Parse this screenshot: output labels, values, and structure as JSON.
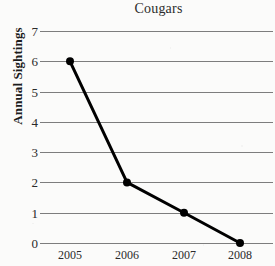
{
  "chart_data": {
    "type": "line",
    "title": "Cougars",
    "xlabel": "",
    "ylabel": "Annual Sightings",
    "categories": [
      "2005",
      "2006",
      "2007",
      "2008"
    ],
    "values": [
      6,
      2,
      1,
      0
    ],
    "series": [
      {
        "name": "Annual Sightings",
        "values": [
          6,
          2,
          1,
          0
        ]
      }
    ],
    "x": [
      2005,
      2006,
      2007,
      2008
    ],
    "ylim": [
      0,
      7
    ],
    "y_ticks": [
      0,
      1,
      2,
      3,
      4,
      5,
      6,
      7
    ],
    "y_tick_labels": [
      "0",
      "1",
      "2",
      "3",
      "4",
      "5",
      "6",
      "7"
    ],
    "x_tick_labels": [
      "2005",
      "2006",
      "2007",
      "2008"
    ],
    "grid": "horizontal",
    "legend": "none",
    "marker": "filled-circle",
    "colors": {
      "line": "#000000",
      "marker": "#000000",
      "gridline": "#7d7d7d",
      "text": "#2a2a2a",
      "background": "#fbfbfa"
    }
  },
  "axes": {
    "y_title": "Annual Sightings",
    "y_ticks": [
      "7",
      "6",
      "5",
      "4",
      "3",
      "2",
      "1",
      "0"
    ],
    "x_ticks": [
      "2005",
      "2006",
      "2007",
      "2008"
    ]
  },
  "header": {
    "title": "Cougars"
  }
}
